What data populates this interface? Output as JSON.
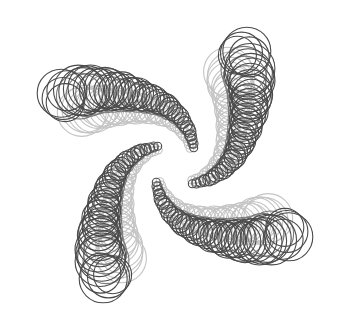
{
  "artwork": {
    "width": 351,
    "height": 329,
    "background": "#ffffff",
    "center": [
      175,
      165
    ],
    "symmetry": 4,
    "stroke_width": 1.1,
    "colors": {
      "dark": "#4a4a4a",
      "mid": "#7a7a7a",
      "light": "#c4c4c4"
    },
    "arm": {
      "spine": [
        [
          80,
          100
        ],
        [
          100,
          97
        ],
        [
          120,
          98
        ],
        [
          140,
          101
        ],
        [
          158,
          106
        ],
        [
          172,
          114
        ],
        [
          182,
          124
        ],
        [
          188,
          134
        ],
        [
          191,
          142
        ],
        [
          192,
          148
        ]
      ],
      "radius_start": 25,
      "radius_end": 4,
      "steps": 34,
      "dark_offset": -10,
      "light_offset": 12,
      "tip_fan": [
        {
          "angle": 200,
          "r": 24,
          "d": 20
        },
        {
          "angle": 185,
          "r": 21,
          "d": 17
        },
        {
          "angle": 170,
          "r": 19,
          "d": 15
        },
        {
          "angle": 215,
          "r": 20,
          "d": 16
        }
      ]
    }
  }
}
